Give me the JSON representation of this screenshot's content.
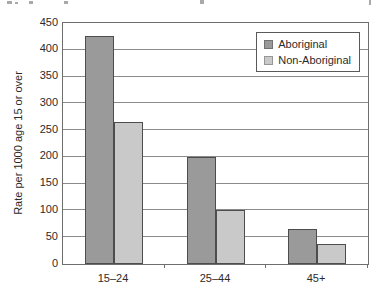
{
  "chart_data": {
    "type": "bar",
    "title": "",
    "categories": [
      "15–24",
      "25–44",
      "45+"
    ],
    "series": [
      {
        "name": "Aboriginal",
        "values": [
          425,
          200,
          65
        ]
      },
      {
        "name": "Non-Aboriginal",
        "values": [
          265,
          100,
          38
        ]
      }
    ],
    "xlabel": "",
    "ylabel": "Rate per 1000 age 15 or over",
    "ylim": [
      0,
      450
    ],
    "ytick_step": 50,
    "grid": true,
    "legend_position": "top-right",
    "colors": {
      "aboriginal": "#9a9a9a",
      "non_aboriginal": "#c9c9c9",
      "bar_border": "#4d4d4d",
      "gridline": "#8a8a8a",
      "frame": "#6e6e6e",
      "text": "#2b2b2b",
      "background": "#ffffff"
    }
  }
}
